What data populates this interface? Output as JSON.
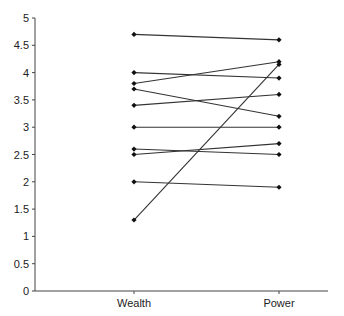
{
  "chart_data": {
    "type": "line",
    "title": "",
    "xlabel": "",
    "ylabel": "",
    "categories": [
      "Wealth",
      "Power"
    ],
    "ylim": [
      0,
      5
    ],
    "yticks": [
      "0",
      "0.5",
      "1",
      "1.5",
      "2",
      "2.5",
      "3",
      "3.5",
      "4",
      "4.5",
      "5"
    ],
    "grid": false,
    "legend": "none",
    "series": [
      {
        "name": "s1",
        "values": [
          4.7,
          4.6
        ]
      },
      {
        "name": "s2",
        "values": [
          4.0,
          3.9
        ]
      },
      {
        "name": "s3",
        "values": [
          3.8,
          4.2
        ]
      },
      {
        "name": "s4",
        "values": [
          3.7,
          3.2
        ]
      },
      {
        "name": "s5",
        "values": [
          3.4,
          3.6
        ]
      },
      {
        "name": "s6",
        "values": [
          3.0,
          3.0
        ]
      },
      {
        "name": "s7",
        "values": [
          2.6,
          2.5
        ]
      },
      {
        "name": "s8",
        "values": [
          2.5,
          2.7
        ]
      },
      {
        "name": "s9",
        "values": [
          2.0,
          1.9
        ]
      },
      {
        "name": "s10",
        "values": [
          1.3,
          4.15
        ]
      }
    ]
  },
  "style": {
    "line_color": "#333333",
    "marker_color": "#111111"
  }
}
